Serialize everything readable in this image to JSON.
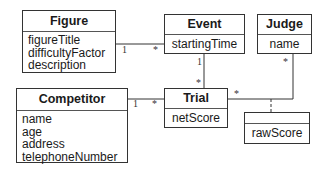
{
  "diagram": {
    "type": "UML class diagram",
    "classes": [
      {
        "id": "figure",
        "name": "Figure",
        "attributes": [
          "figureTitle",
          "difficultyFactor",
          "description"
        ]
      },
      {
        "id": "event",
        "name": "Event",
        "attributes": [
          "startingTime"
        ]
      },
      {
        "id": "judge",
        "name": "Judge",
        "attributes": [
          "name"
        ]
      },
      {
        "id": "competitor",
        "name": "Competitor",
        "attributes": [
          "name",
          "age",
          "address",
          "telephoneNumber"
        ]
      },
      {
        "id": "trial",
        "name": "Trial",
        "attributes": [
          "netScore"
        ]
      },
      {
        "id": "association-class",
        "name": "",
        "attributes": [
          "rawScore"
        ]
      }
    ],
    "associations": [
      {
        "from": "Figure",
        "to": "Event",
        "from_mult": "1",
        "to_mult": "*"
      },
      {
        "from": "Event",
        "to": "Trial",
        "from_mult": "1",
        "to_mult": "*"
      },
      {
        "from": "Competitor",
        "to": "Trial",
        "from_mult": "1",
        "to_mult": "*"
      },
      {
        "from": "Trial",
        "to": "Judge",
        "from_mult": "*",
        "to_mult": "*",
        "association_class": "rawScore"
      }
    ]
  }
}
